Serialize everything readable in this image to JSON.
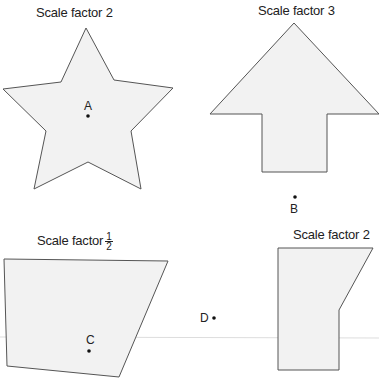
{
  "colors": {
    "shape_fill": "#f2f2f2",
    "shape_stroke": "#555555",
    "text": "#222222",
    "guide_line": "#dddddd"
  },
  "shapes": [
    {
      "id": "star",
      "label": "Scale factor 2",
      "centre": "A",
      "points": [
        [
          86,
          28
        ],
        [
          114,
          80
        ],
        [
          173,
          88
        ],
        [
          131,
          131
        ],
        [
          141,
          189
        ],
        [
          88,
          162
        ],
        [
          34,
          189
        ],
        [
          46,
          131
        ],
        [
          3,
          89
        ],
        [
          61,
          82
        ]
      ]
    },
    {
      "id": "arrow",
      "label": "Scale factor 3",
      "centre": "B",
      "points": [
        [
          294,
          23
        ],
        [
          379,
          114
        ],
        [
          327,
          114
        ],
        [
          327,
          172
        ],
        [
          262,
          172
        ],
        [
          262,
          114
        ],
        [
          210,
          114
        ]
      ]
    },
    {
      "id": "quadrilateral",
      "label_prefix": "Scale factor",
      "label_frac_num": "1",
      "label_frac_den": "2",
      "centre": "C",
      "points": [
        [
          4,
          259
        ],
        [
          168,
          261
        ],
        [
          119,
          377
        ],
        [
          7,
          366
        ]
      ]
    },
    {
      "id": "pentagon",
      "label": "Scale factor 2",
      "centre": "D",
      "points": [
        [
          278,
          248
        ],
        [
          373,
          248
        ],
        [
          339,
          310
        ],
        [
          339,
          370
        ],
        [
          278,
          370
        ]
      ]
    }
  ],
  "centres": {
    "A": "A",
    "B": "B",
    "C": "C",
    "D": "D"
  }
}
